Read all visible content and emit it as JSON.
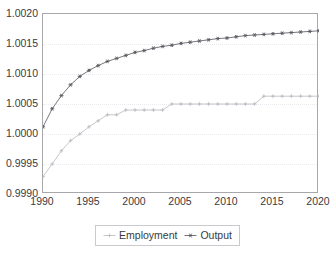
{
  "chart_data": {
    "type": "line",
    "title": "",
    "xlabel": "",
    "ylabel": "",
    "xlim": [
      1990,
      2020
    ],
    "ylim": [
      0.999,
      1.002
    ],
    "grid": true,
    "legend_position": "bottom-center",
    "x": [
      1990,
      1991,
      1992,
      1993,
      1994,
      1995,
      1996,
      1997,
      1998,
      1999,
      2000,
      2001,
      2002,
      2003,
      2004,
      2005,
      2006,
      2007,
      2008,
      2009,
      2010,
      2011,
      2012,
      2013,
      2014,
      2015,
      2016,
      2017,
      2018,
      2019,
      2020
    ],
    "xticks": [
      "1990",
      "1995",
      "2000",
      "2005",
      "2010",
      "2015",
      "2020"
    ],
    "xtick_values": [
      1990,
      1995,
      2000,
      2005,
      2010,
      2015,
      2020
    ],
    "yticks": [
      "0.9990",
      "0.9995",
      "1.0000",
      "1.0005",
      "1.0010",
      "1.0015",
      "1.0020"
    ],
    "ytick_values": [
      0.999,
      0.9995,
      1.0,
      1.0005,
      1.001,
      1.0015,
      1.002
    ],
    "series": [
      {
        "name": "Employment",
        "marker": "plus",
        "color": "#b9b9c0",
        "values": [
          0.99929,
          0.9995,
          0.99972,
          0.99989,
          1.0,
          1.00012,
          1.00022,
          1.00032,
          1.00032,
          1.0004,
          1.0004,
          1.0004,
          1.0004,
          1.0004,
          1.0005,
          1.0005,
          1.0005,
          1.0005,
          1.0005,
          1.0005,
          1.0005,
          1.0005,
          1.0005,
          1.0005,
          1.00063,
          1.00063,
          1.00063,
          1.00063,
          1.00063,
          1.00063,
          1.00063
        ]
      },
      {
        "name": "Output",
        "marker": "asterisk",
        "color": "#55555c",
        "values": [
          1.00012,
          1.00042,
          1.00064,
          1.00082,
          1.00096,
          1.00106,
          1.00114,
          1.00121,
          1.00126,
          1.00131,
          1.00136,
          1.00139,
          1.00143,
          1.00146,
          1.00148,
          1.00151,
          1.00153,
          1.00155,
          1.00157,
          1.00159,
          1.0016,
          1.00162,
          1.00164,
          1.00165,
          1.00166,
          1.00167,
          1.00168,
          1.00169,
          1.0017,
          1.00171,
          1.00172
        ]
      }
    ]
  },
  "legend": {
    "items": [
      {
        "label": "Employment",
        "marker": "plus-marker-icon"
      },
      {
        "label": "Output",
        "marker": "asterisk-marker-icon"
      }
    ]
  },
  "colors": {
    "frame": "#a8a8ac",
    "grid": "#e9e9ee",
    "text": "#3a3a3e",
    "employment": "#b9b9c0",
    "output": "#55555c",
    "background": "#ffffff"
  }
}
